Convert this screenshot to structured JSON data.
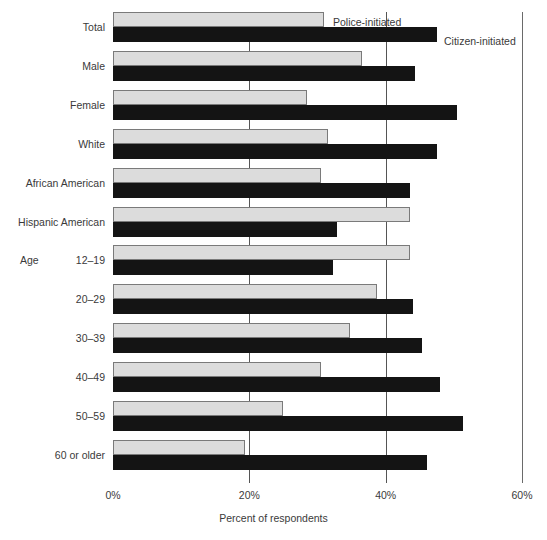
{
  "chart_data": {
    "type": "bar",
    "orientation": "horizontal",
    "title": "",
    "xlabel": "Percent of respondents",
    "ylabel": "",
    "xlim": [
      0,
      60
    ],
    "xticks": [
      "0%",
      "20%",
      "40%",
      "60%"
    ],
    "xtick_values": [
      0,
      20,
      40,
      60
    ],
    "grid": true,
    "grid_axis": "x",
    "legend": [
      {
        "name": "Police-initiated",
        "color": "#dcdcdc"
      },
      {
        "name": "Citizen-initiated",
        "color": "#141414"
      }
    ],
    "legend_position": "inline-right-of-first-bars",
    "group_label": "Age",
    "categories": [
      "Total",
      "Male",
      "Female",
      "White",
      "African American",
      "Hispanic American",
      "12–19",
      "20–29",
      "30–39",
      "40–49",
      "50–59",
      "60 or older"
    ],
    "series": [
      {
        "name": "Police-initiated",
        "color": "#dcdcdc",
        "values": [
          31.0,
          36.5,
          28.5,
          31.5,
          30.5,
          43.5,
          43.5,
          38.8,
          34.8,
          30.5,
          25.0,
          19.3
        ]
      },
      {
        "name": "Citizen-initiated",
        "color": "#141414",
        "values": [
          47.5,
          44.3,
          50.5,
          47.5,
          43.5,
          32.8,
          32.3,
          44.0,
          45.3,
          48.0,
          51.3,
          46.0
        ]
      }
    ]
  },
  "axis": {
    "x_title": "Percent of respondents"
  },
  "colors": {
    "police": "#dcdcdc",
    "citizen": "#141414",
    "gridline": "#555555",
    "text": "#3a3a3a",
    "background": "#ffffff"
  }
}
